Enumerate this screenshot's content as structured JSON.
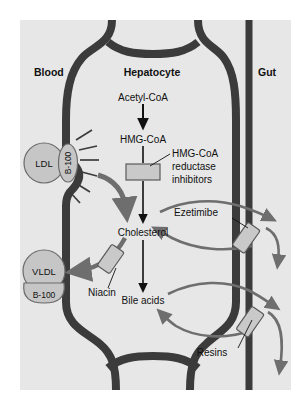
{
  "figure": {
    "panel_bg": "#e7e7e7",
    "page_bg": "#ffffff",
    "membrane_color": "#3b3b3b",
    "arrow_gray": "#6e6e6e",
    "arrow_black": "#111111",
    "block_fill": "#c9c9c9",
    "block_stroke": "#5a5a5a",
    "particle_fill": "#c6c6c6",
    "particle_stroke": "#6a6a6a",
    "text_color": "#111111"
  },
  "compartments": [
    {
      "id": "blood",
      "label": "Blood"
    },
    {
      "id": "hepatocyte",
      "label": "Hepatocyte"
    },
    {
      "id": "gut",
      "label": "Gut"
    }
  ],
  "metabolites": [
    {
      "id": "acetyl-coa",
      "label": "Acetyl-CoA"
    },
    {
      "id": "hmg-coa",
      "label": "HMG-CoA"
    },
    {
      "id": "cholesterol",
      "label": "Cholesterol"
    },
    {
      "id": "bile-acids",
      "label": "Bile acids"
    }
  ],
  "lipoproteins": [
    {
      "id": "ldl",
      "label": "LDL",
      "apo": "B-100"
    },
    {
      "id": "vldl",
      "label": "VLDL",
      "apo": "B-100"
    }
  ],
  "drugs": [
    {
      "id": "statins",
      "label": "HMG-CoA\nreductase\ninhibitors",
      "line1": "HMG-CoA",
      "line2": "reductase",
      "line3": "inhibitors"
    },
    {
      "id": "niacin",
      "label": "Niacin"
    },
    {
      "id": "ezetimibe",
      "label": "Ezetimibe"
    },
    {
      "id": "resins",
      "label": "Resins"
    }
  ],
  "pathway_steps": [
    {
      "from": "Acetyl-CoA",
      "to": "HMG-CoA"
    },
    {
      "from": "HMG-CoA",
      "to": "Cholesterol"
    },
    {
      "from": "Cholesterol",
      "to": "Bile acids"
    },
    {
      "from": "LDL",
      "to": "Cholesterol"
    },
    {
      "from": "Cholesterol",
      "to": "VLDL"
    }
  ]
}
